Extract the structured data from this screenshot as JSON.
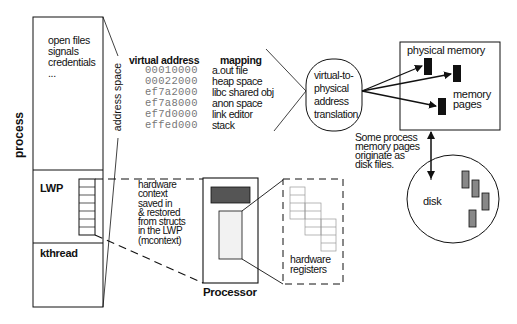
{
  "process": {
    "label": "process",
    "attributes": [
      "open files",
      "signals",
      "credentials",
      "..."
    ],
    "lwp_label": "LWP",
    "kthread_label": "kthread"
  },
  "address_space": {
    "label": "address space",
    "table": {
      "headers": [
        "virtual address",
        "mapping"
      ],
      "rows": [
        {
          "address": "00010000",
          "mapping": "a.out file"
        },
        {
          "address": "00022000",
          "mapping": "heap space"
        },
        {
          "address": "ef7a2000",
          "mapping": "libc shared obj"
        },
        {
          "address": "ef7a8000",
          "mapping": "anon space"
        },
        {
          "address": "ef7d0000",
          "mapping": "link editor"
        },
        {
          "address": "effed000",
          "mapping": "stack"
        }
      ]
    }
  },
  "translation": {
    "lines": [
      "virtual-to-",
      "physical",
      "address",
      "translation"
    ]
  },
  "physical_memory": {
    "title": "physical memory",
    "pages_label": [
      "memory",
      "pages"
    ]
  },
  "note": {
    "lines": [
      "Some process",
      "memory pages",
      "originate as",
      "disk files."
    ]
  },
  "disk": {
    "label": "disk"
  },
  "hardware_context": {
    "lines": [
      "hardware",
      "context",
      "saved in",
      "& restored",
      "from structs",
      "in the LWP",
      "(mcontext)"
    ]
  },
  "processor": {
    "label": "Processor"
  },
  "hardware_registers": {
    "lines": [
      "hardware",
      "registers"
    ]
  },
  "colors": {
    "line": "#111111",
    "mono_text": "#777777",
    "page_fill": "#111111",
    "disk_block_fill": "#888888",
    "processor_dark": "#555555",
    "processor_light": "#f2f2f2",
    "register_grid": "#999999"
  }
}
